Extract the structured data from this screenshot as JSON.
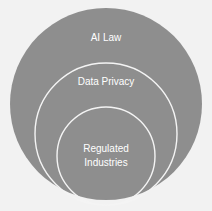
{
  "diagram": {
    "type": "nested-circles",
    "colors": {
      "background": "#f2f2f2",
      "circle_fill": "#8e8e8e",
      "circle_stroke": "#f4f4f4",
      "label": "#ffffff"
    },
    "circles": [
      {
        "label": "AI Law",
        "level": "outer"
      },
      {
        "label": "Data Privacy",
        "level": "middle"
      },
      {
        "label_line1": "Regulated",
        "label_line2": "Industries",
        "level": "inner"
      }
    ]
  }
}
